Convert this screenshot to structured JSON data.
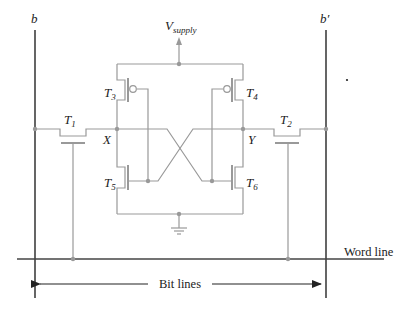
{
  "diagram": {
    "type": "6T SRAM cell",
    "colors": {
      "bit_line": "#555555",
      "circuit": "#999999",
      "node_dot": "#999999",
      "text": "#222222",
      "background": "#ffffff"
    },
    "labels": {
      "bitline_left": "b",
      "bitline_right": "b′",
      "supply_main": "V",
      "supply_sub": "supply",
      "node_x": "X",
      "node_y": "Y",
      "word_line": "Word line",
      "bit_lines": "Bit lines"
    },
    "transistors": [
      {
        "id": "T1",
        "main": "T",
        "sub": "1",
        "type": "nmos",
        "role": "access"
      },
      {
        "id": "T2",
        "main": "T",
        "sub": "2",
        "type": "nmos",
        "role": "access"
      },
      {
        "id": "T3",
        "main": "T",
        "sub": "3",
        "type": "pmos",
        "role": "pull-up"
      },
      {
        "id": "T4",
        "main": "T",
        "sub": "4",
        "type": "pmos",
        "role": "pull-up"
      },
      {
        "id": "T5",
        "main": "T",
        "sub": "5",
        "type": "nmos",
        "role": "pull-down"
      },
      {
        "id": "T6",
        "main": "T",
        "sub": "6",
        "type": "nmos",
        "role": "pull-down"
      }
    ]
  }
}
